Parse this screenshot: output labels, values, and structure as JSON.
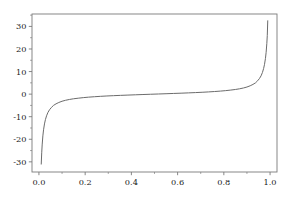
{
  "figure": {
    "background_color": "#ffffff",
    "axes_color": "#7a7a7a",
    "tick_label_color": "#1a1a1a",
    "line_color": "#6b6b6b"
  },
  "chart_data": {
    "type": "line",
    "title": "",
    "subtitle": "",
    "xlabel": "",
    "ylabel": "",
    "xlim": [
      -0.03,
      1.03
    ],
    "ylim": [
      -34.5,
      35.5
    ],
    "grid": false,
    "legend": null,
    "xticks": [
      0.0,
      0.2,
      0.4,
      0.6,
      0.8,
      1.0
    ],
    "xtick_labels": [
      "0.0",
      "0.2",
      "0.4",
      "0.6",
      "0.8",
      "1.0"
    ],
    "yticks": [
      -30,
      -20,
      -10,
      0,
      10,
      20,
      30
    ],
    "ytick_labels": [
      "-30",
      "-20",
      "-10",
      "0",
      "10",
      "20",
      "30"
    ],
    "xminor_ticks": [
      0.1,
      0.3,
      0.5,
      0.7,
      0.9
    ],
    "yminor_ticks": [
      -35,
      -25,
      -15,
      -5,
      5,
      15,
      25,
      35
    ],
    "series": [
      {
        "name": "quantile-curve",
        "color": "#6b6b6b",
        "linewidth": 1.0,
        "x": [
          0.01,
          0.012,
          0.014,
          0.017,
          0.02,
          0.024,
          0.028,
          0.033,
          0.039,
          0.046,
          0.054,
          0.063,
          0.074,
          0.086,
          0.1,
          0.115,
          0.132,
          0.15,
          0.17,
          0.192,
          0.215,
          0.24,
          0.266,
          0.294,
          0.323,
          0.353,
          0.385,
          0.417,
          0.45,
          0.483,
          0.517,
          0.55,
          0.583,
          0.615,
          0.647,
          0.677,
          0.706,
          0.734,
          0.76,
          0.785,
          0.808,
          0.83,
          0.85,
          0.868,
          0.885,
          0.9,
          0.914,
          0.926,
          0.937,
          0.946,
          0.954,
          0.961,
          0.967,
          0.972,
          0.976,
          0.98,
          0.983,
          0.986,
          0.988,
          0.99
        ],
        "y": [
          -31.0,
          -26.0,
          -22.5,
          -18.5,
          -15.8,
          -13.2,
          -11.3,
          -9.6,
          -8.1,
          -6.9,
          -5.9,
          -5.0,
          -4.3,
          -3.7,
          -3.15,
          -2.73,
          -2.36,
          -2.06,
          -1.8,
          -1.55,
          -1.34,
          -1.15,
          -0.98,
          -0.82,
          -0.68,
          -0.55,
          -0.42,
          -0.3,
          -0.18,
          -0.06,
          0.06,
          0.18,
          0.3,
          0.42,
          0.55,
          0.68,
          0.82,
          0.98,
          1.15,
          1.34,
          1.55,
          1.8,
          2.06,
          2.36,
          2.73,
          3.15,
          3.7,
          4.3,
          5.0,
          5.9,
          6.9,
          8.1,
          9.6,
          11.3,
          13.2,
          15.8,
          18.5,
          22.5,
          26.0,
          32.5
        ]
      }
    ]
  }
}
